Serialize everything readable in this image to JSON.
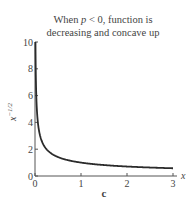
{
  "chart_data": {
    "type": "line",
    "title": "When p < 0, function is decreasing and concave up",
    "title_lines": [
      "When ",
      "p",
      " < 0, function is",
      "decreasing and concave up"
    ],
    "xlabel": "x",
    "ylabel": "x^{-1/2}",
    "ylabel_base": "x",
    "ylabel_exp": "−1/2",
    "xlim": [
      0,
      3
    ],
    "ylim": [
      0,
      10
    ],
    "x_ticks": [
      0,
      1,
      2,
      3
    ],
    "x_tick_labels": [
      "0",
      "1",
      "2",
      "3"
    ],
    "y_ticks": [
      0,
      2,
      4,
      6,
      8,
      10
    ],
    "y_tick_labels": [
      "0",
      "2",
      "4",
      "6",
      "8",
      "10"
    ],
    "grid": false,
    "panel_label": "c",
    "series": [
      {
        "name": "x^{-1/2}",
        "function": "x^(-1/2)",
        "x_start": 0.01,
        "x_end": 3.0,
        "sample_points": [
          [
            0.01,
            10
          ],
          [
            0.05,
            4.47
          ],
          [
            0.1,
            3.16
          ],
          [
            0.25,
            2
          ],
          [
            0.5,
            1.41
          ],
          [
            1,
            1
          ],
          [
            1.5,
            0.82
          ],
          [
            2,
            0.71
          ],
          [
            2.5,
            0.63
          ],
          [
            3,
            0.58
          ]
        ]
      }
    ],
    "colors": {
      "curve": "#2b2b2b",
      "axis": "#555555",
      "text": "#444444"
    }
  }
}
